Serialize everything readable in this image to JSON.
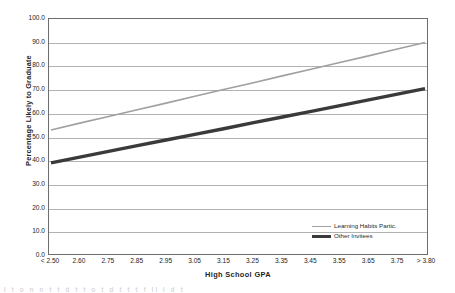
{
  "chart_data": {
    "type": "line",
    "title": "",
    "xlabel": "High School GPA",
    "ylabel": "Percentage Likely to Graduate",
    "categories": [
      "< 2.50",
      "2.60",
      "2.75",
      "2.85",
      "2.95",
      "3.05",
      "3.15",
      "3.25",
      "3.35",
      "3.45",
      "3.55",
      "3.65",
      "3.75",
      "> 3.80"
    ],
    "ylim": [
      0.0,
      100.0
    ],
    "yticks": [
      "0.0",
      "10.0",
      "20.0",
      "30.0",
      "40.0",
      "50.0",
      "60.0",
      "70.0",
      "80.0",
      "90.0",
      "100.0"
    ],
    "ytick_values": [
      0,
      10,
      20,
      30,
      40,
      50,
      60,
      70,
      80,
      90,
      100
    ],
    "grid": true,
    "legend_position": "bottom-right",
    "series": [
      {
        "name": "Learning Habits Partic.",
        "color": "#a0a0a0",
        "width": 1.6,
        "values": [
          52.8,
          55.7,
          58.5,
          61.4,
          64.2,
          67.1,
          70.0,
          72.8,
          75.7,
          78.5,
          81.4,
          84.2,
          87.1,
          90.0
        ]
      },
      {
        "name": "Other Invitees",
        "color": "#3a3a3a",
        "width": 3.4,
        "values": [
          38.8,
          41.2,
          43.7,
          46.1,
          48.5,
          50.9,
          53.3,
          55.8,
          58.2,
          60.6,
          63.0,
          65.5,
          67.9,
          70.4
        ]
      }
    ]
  },
  "axis": {
    "y_title": "Percentage Likely to Graduate",
    "x_title": "High School GPA"
  },
  "footer": {
    "text": "l t o n n t t d t t o t d t t t f ll l d t"
  }
}
